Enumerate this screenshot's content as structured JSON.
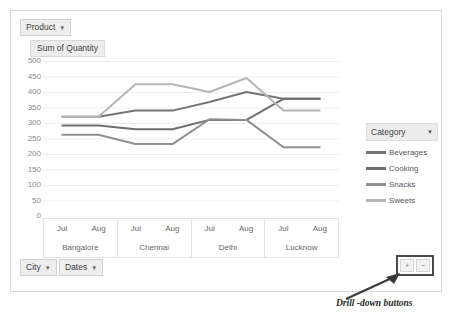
{
  "card": {
    "product_filter": {
      "label": "Product",
      "caret": "chevron-down-icon"
    },
    "value_field": "Sum of Quantity"
  },
  "legend": {
    "header": "Category",
    "caret": "chevron-down-icon",
    "items": [
      {
        "label": "Beverages",
        "color": "#757575"
      },
      {
        "label": "Cooking",
        "color": "#6e6e6e"
      },
      {
        "label": "Snacks",
        "color": "#8f8f8f"
      },
      {
        "label": "Sweets",
        "color": "#b5b5b5"
      }
    ]
  },
  "bottom": {
    "city_filter": "City",
    "dates_filter": "Dates",
    "drill_up": "+",
    "drill_down": "−"
  },
  "annotation": {
    "text": "Drill -down buttons"
  },
  "chart_data": {
    "type": "line",
    "title": "Sum of Quantity",
    "xlabel": "",
    "ylabel": "",
    "ylim": [
      0,
      500
    ],
    "ytick_step": 50,
    "yticks": [
      500,
      450,
      400,
      350,
      300,
      250,
      200,
      150,
      100,
      50,
      0
    ],
    "grid": true,
    "legend_position": "right",
    "x": [
      "Bangalore Jul",
      "Bangalore Aug",
      "Chennai Jul",
      "Chennai Aug",
      "Delhi Jul",
      "Delhi Aug",
      "Lucknow Jul",
      "Lucknow Aug"
    ],
    "groups": [
      {
        "label": "Bangalore",
        "months": [
          "Jul",
          "Aug"
        ]
      },
      {
        "label": "Chennai",
        "months": [
          "Jul",
          "Aug"
        ]
      },
      {
        "label": "Delhi",
        "months": [
          "Jul",
          "Aug"
        ]
      },
      {
        "label": "Lucknow",
        "months": [
          "Jul",
          "Aug"
        ]
      }
    ],
    "series": [
      {
        "name": "Beverages",
        "color": "#757575",
        "values": [
          320,
          320,
          340,
          340,
          368,
          400,
          378,
          378
        ]
      },
      {
        "name": "Cooking",
        "color": "#6e6e6e",
        "values": [
          292,
          292,
          280,
          280,
          310,
          310,
          378,
          378
        ]
      },
      {
        "name": "Snacks",
        "color": "#8f8f8f",
        "values": [
          262,
          262,
          232,
          232,
          312,
          310,
          222,
          222
        ]
      },
      {
        "name": "Sweets",
        "color": "#b5b5b5",
        "values": [
          320,
          320,
          425,
          425,
          400,
          445,
          340,
          340
        ]
      }
    ]
  }
}
